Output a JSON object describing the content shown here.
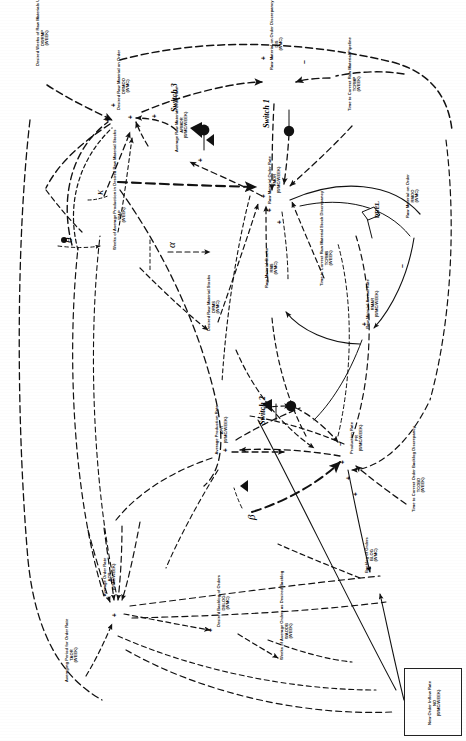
{
  "diagram": {
    "orientation": "rotated-90-ccw",
    "background": "#ffffff",
    "line_color": "#111111",
    "variables": [
      {
        "id": "dwrmc",
        "name": "Desired Weeks of Raw Materials Usage in the Pipeline\nDWRMP\n(WEEK)",
        "x": 36,
        "y": 66,
        "w": 54
      },
      {
        "id": "drmoo",
        "name": "Desired Raw Material on Order\nDRMOO\n(WMC)",
        "x": 117,
        "y": 110,
        "w": 46
      },
      {
        "id": "armor",
        "name": "Average Raw Material Order Rate\nARMOR\n(WMC/WEEK)",
        "x": 175,
        "y": 152,
        "w": 52
      },
      {
        "id": "rmood",
        "name": "Raw Material on Order Discrepancy\nDIS\n(WMC)",
        "x": 270,
        "y": 70,
        "w": 50
      },
      {
        "id": "tcrmp",
        "name": "Time to Correct Raw Material Pipeline\nTCRMP\n(WEEK)",
        "x": 348,
        "y": 111,
        "w": 52
      },
      {
        "id": "rmor",
        "name": "Raw Material Order Rate\nRMOR\n(WMC/WEEK)",
        "x": 268,
        "y": 205,
        "w": 48
      },
      {
        "id": "rmoo",
        "name": "Raw Material on Order\nRMOO\n(WMC)",
        "x": 406,
        "y": 219,
        "w": 44
      },
      {
        "id": "rmar",
        "name": "Raw Material Arrival Rate\nRMAR\n(WMC/WEEK)",
        "x": 366,
        "y": 330,
        "w": 50
      },
      {
        "id": "wap",
        "name": "Weeks of Average Production in Desired Raw Material Stocks\nWAP\n(WEEK)",
        "x": 113,
        "y": 250,
        "w": 68
      },
      {
        "id": "drms",
        "name": "Desired Raw Material Stocks\nDRMS\n(WMC)",
        "x": 207,
        "y": 331,
        "w": 46
      },
      {
        "id": "rms",
        "name": "Raw Material Stocks\nRMS\n(WMC)",
        "x": 265,
        "y": 290,
        "w": 42
      },
      {
        "id": "tcrmsd",
        "name": "Time to Correct Raw Material Stock Discrepancy\nTCRMS\n(WEEK)",
        "x": 320,
        "y": 286,
        "w": 54
      },
      {
        "id": "apr",
        "name": "Average Production Rate\nAPR\n(WMC/WEEK)",
        "x": 215,
        "y": 455,
        "w": 48
      },
      {
        "id": "pr",
        "name": "Production Rate\nPR\n(WMC/WEEK)",
        "x": 350,
        "y": 462,
        "w": 46
      },
      {
        "id": "tcobd",
        "name": "Time to Correct Order Backlog Discrepancy\nTCOBD\n(WEEK)",
        "x": 412,
        "y": 512,
        "w": 52
      },
      {
        "id": "blog",
        "name": "Backlog of Orders\nBLOG\n(WMC)",
        "x": 365,
        "y": 577,
        "w": 42
      },
      {
        "id": "aor",
        "name": "Average Order Rate\nAOR\n(WMC/WEEK)",
        "x": 103,
        "y": 601,
        "w": 46
      },
      {
        "id": "taor",
        "name": "Averaging Period for Order Rate\nTAOR\n(WEEK)",
        "x": 65,
        "y": 682,
        "w": 52
      },
      {
        "id": "dblog",
        "name": "Desired Backlog of Orders\nDBLOG\n(WMC)",
        "x": 217,
        "y": 627,
        "w": 46
      },
      {
        "id": "waodb",
        "name": "Weeks of Average Orders as Desired Backlog\nWAODB\n(WEEK)",
        "x": 280,
        "y": 660,
        "w": 56
      },
      {
        "id": "no",
        "name": "New Order Inflow Rate\nNO\n(WMC/WEEK)",
        "x": 428,
        "y": 700,
        "w": 44
      }
    ],
    "switches": [
      {
        "id": "sw3",
        "label": "Switch 3",
        "x": 170,
        "y": 112
      },
      {
        "id": "sw1",
        "label": "Switch 1",
        "x": 262,
        "y": 128
      },
      {
        "id": "sw2",
        "label": "Switch 2",
        "x": 258,
        "y": 425
      }
    ],
    "greek_params": [
      {
        "id": "alpha",
        "label": "α",
        "x": 165,
        "y": 248
      },
      {
        "id": "beta",
        "label": "β",
        "x": 245,
        "y": 520
      },
      {
        "id": "theta",
        "label": "θ",
        "x": 62,
        "y": 243
      },
      {
        "id": "kappa",
        "label": "κ",
        "x": 93,
        "y": 195
      }
    ],
    "delay": {
      "id": "ddel",
      "label": "DDEL",
      "x": 374,
      "y": 218
    },
    "polarity_plus": "+",
    "polarity_minus": "–",
    "legend_note": ""
  }
}
